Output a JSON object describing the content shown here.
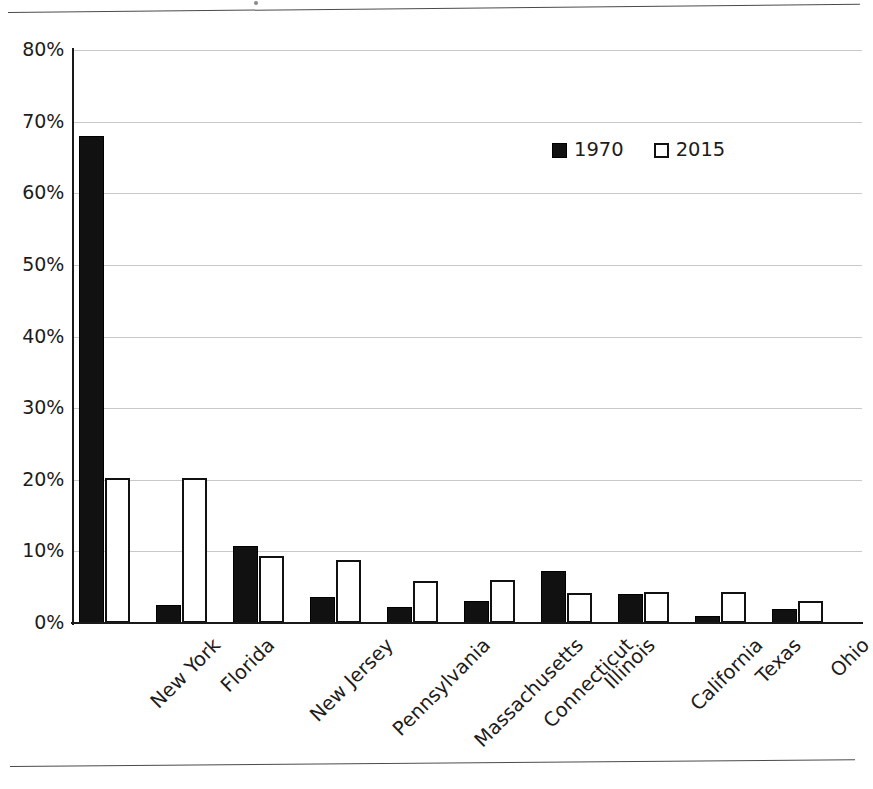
{
  "chart_data": {
    "type": "bar",
    "title": "",
    "xlabel": "",
    "ylabel": "",
    "ylim": [
      0,
      80
    ],
    "y_ticks": [
      "0%",
      "10%",
      "20%",
      "30%",
      "40%",
      "50%",
      "60%",
      "70%",
      "80%"
    ],
    "y_tick_values": [
      0,
      10,
      20,
      30,
      40,
      50,
      60,
      70,
      80
    ],
    "grid": "horizontal",
    "legend_position": "top-right-inside",
    "categories": [
      "New York",
      "Florida",
      "New Jersey",
      "Pennsylvania",
      "Massachusetts",
      "Connecticut",
      "Illinois",
      "California",
      "Texas",
      "Ohio"
    ],
    "series": [
      {
        "name": "1970",
        "color": "#111111",
        "style": "filled",
        "values": [
          68.0,
          2.5,
          10.8,
          3.6,
          2.3,
          3.1,
          7.3,
          4.1,
          1.0,
          1.9
        ]
      },
      {
        "name": "2015",
        "color": "#ffffff",
        "style": "hollow",
        "values": [
          20.3,
          20.2,
          9.3,
          8.8,
          5.9,
          6.0,
          4.2,
          4.4,
          4.3,
          3.1
        ]
      }
    ]
  },
  "legend": {
    "items": [
      {
        "label": "1970",
        "swatch": "filled-square"
      },
      {
        "label": "2015",
        "swatch": "hollow-square"
      }
    ]
  },
  "page": {
    "rule_top": "",
    "rule_bottom": ""
  }
}
